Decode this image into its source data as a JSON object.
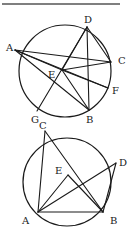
{
  "figures": [
    {
      "id": "top",
      "circle": {
        "cx": 65,
        "cy": 71,
        "r": 46
      },
      "points": {
        "A": {
          "x": 15,
          "y": 50,
          "lx": 6,
          "ly": 51
        },
        "D": {
          "x": 87,
          "y": 27,
          "lx": 84,
          "ly": 23
        },
        "C": {
          "x": 111,
          "y": 62,
          "lx": 118,
          "ly": 64
        },
        "F": {
          "x": 108,
          "y": 88,
          "lx": 112,
          "ly": 94
        },
        "B": {
          "x": 89,
          "y": 110,
          "lx": 86,
          "ly": 123
        },
        "G": {
          "x": 37,
          "y": 111,
          "lx": 31,
          "ly": 123
        },
        "E": {
          "x": 62,
          "y": 70,
          "lx": 48,
          "ly": 78
        }
      },
      "segments": [
        [
          "A",
          "C"
        ],
        [
          "A",
          "E"
        ],
        [
          "A",
          "B"
        ],
        [
          "A",
          "F"
        ],
        [
          "D",
          "C"
        ],
        [
          "D",
          "B"
        ],
        [
          "D",
          "G"
        ],
        [
          "D",
          "E"
        ],
        [
          "E",
          "C"
        ],
        [
          "E",
          "F"
        ],
        [
          "E",
          "B"
        ]
      ]
    },
    {
      "id": "bottom",
      "circle": {
        "cx": 67,
        "cy": 182,
        "r": 44
      },
      "points": {
        "C": {
          "x": 45,
          "y": 131,
          "lx": 39,
          "ly": 129
        },
        "D": {
          "x": 116,
          "y": 163,
          "lx": 119,
          "ly": 166
        },
        "A": {
          "x": 38,
          "y": 212,
          "lx": 22,
          "ly": 224
        },
        "B": {
          "x": 103,
          "y": 212,
          "lx": 110,
          "ly": 224
        },
        "E": {
          "x": 68,
          "y": 175,
          "lx": 55,
          "ly": 174
        }
      },
      "segments": [
        [
          "C",
          "A"
        ],
        [
          "C",
          "B"
        ],
        [
          "A",
          "B"
        ],
        [
          "A",
          "D"
        ],
        [
          "D",
          "B"
        ],
        [
          "A",
          "E"
        ],
        [
          "E",
          "B"
        ]
      ]
    }
  ],
  "rule": {
    "x1": 2,
    "y1": 4,
    "x2": 120,
    "y2": 4
  },
  "labels": [
    "A",
    "B",
    "C",
    "D",
    "E",
    "F",
    "G"
  ]
}
